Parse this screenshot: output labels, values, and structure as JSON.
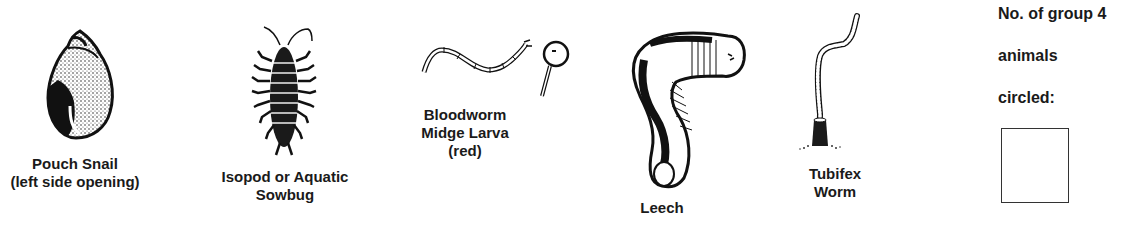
{
  "animals": [
    {
      "id": "pouch-snail",
      "label_lines": [
        "Pouch Snail",
        "(left side opening)"
      ]
    },
    {
      "id": "isopod",
      "label_lines": [
        "Isopod or Aquatic",
        "Sowbug"
      ]
    },
    {
      "id": "bloodworm",
      "label_lines": [
        "Bloodworm",
        "Midge Larva",
        "(red)"
      ]
    },
    {
      "id": "leech",
      "label_lines": [
        "Leech"
      ]
    },
    {
      "id": "tubifex",
      "label_lines": [
        "Tubifex",
        "Worm"
      ]
    }
  ],
  "tally": {
    "lines": [
      "No. of group 4",
      "animals",
      "circled:"
    ],
    "value": ""
  },
  "colors": {
    "ink": "#1a1a1a",
    "background": "#ffffff"
  }
}
